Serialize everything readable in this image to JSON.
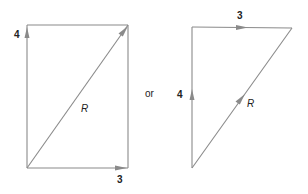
{
  "diagram": {
    "type": "vector-addition",
    "line_color": "#8a8a8a",
    "text_color": "#222222",
    "connector_label": "or",
    "left_figure": {
      "name": "parallelogram-rectangle",
      "vertical_vector": {
        "label": "4"
      },
      "horizontal_vector": {
        "label": "3"
      },
      "resultant": {
        "label": "R"
      }
    },
    "right_figure": {
      "name": "head-to-tail-triangle",
      "vertical_vector": {
        "label": "4"
      },
      "horizontal_vector": {
        "label": "3"
      },
      "resultant": {
        "label": "R"
      }
    }
  }
}
